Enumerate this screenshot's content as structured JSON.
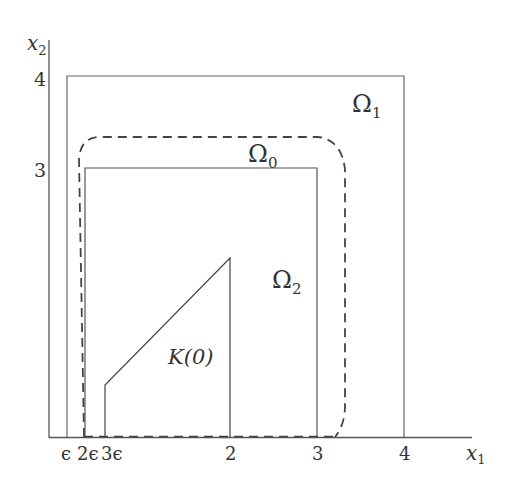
{
  "diagram": {
    "axes": {
      "x_label": "x",
      "x_label_sub": "1",
      "y_label": "x",
      "y_label_sub": "2",
      "x_ticks": [
        {
          "label": "ϵ"
        },
        {
          "label": "2ϵ"
        },
        {
          "label": "3ϵ"
        },
        {
          "label": "2"
        },
        {
          "label": "3"
        },
        {
          "label": "4"
        }
      ],
      "y_ticks": [
        {
          "label": "4"
        },
        {
          "label": "3"
        }
      ]
    },
    "regions": {
      "omega1": {
        "symbol": "Ω",
        "sub": "1"
      },
      "omega0": {
        "symbol": "Ω",
        "sub": "0"
      },
      "omega2": {
        "symbol": "Ω",
        "sub": "2"
      },
      "k0": {
        "label": "K(0)"
      }
    },
    "colors": {
      "line": "#555555",
      "dashed": "#444444",
      "text": "#333333"
    }
  }
}
